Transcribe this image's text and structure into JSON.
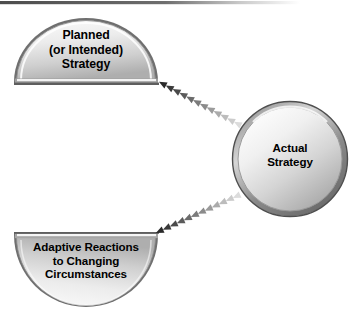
{
  "diagram": {
    "background_color": "#ffffff",
    "top_rule": {
      "name": "top-border-rule",
      "color": "#5a5a5a"
    },
    "nodes": [
      {
        "id": "planned-strategy",
        "shape": "dome-semicircle",
        "label": "Planned\n(or Intended)\nStrategy",
        "lines": [
          "Planned",
          "(or Intended)",
          "Strategy"
        ],
        "fill_light": "#f2f2f2",
        "fill_dark": "#b4b4b4",
        "border_color": "#6b6b6b"
      },
      {
        "id": "actual-strategy",
        "shape": "circle",
        "label": "Actual\nStrategy",
        "lines": [
          "Actual",
          "Strategy"
        ],
        "fill_light": "#f4f4f4",
        "fill_dark": "#b0b0b0",
        "border_color": "#707070"
      },
      {
        "id": "adaptive-reactions",
        "shape": "inverted-dome-semicircle",
        "label": "Adaptive Reactions\nto Changing\nCircumstances",
        "lines": [
          "Adaptive Reactions",
          "to Changing",
          "Circumstances"
        ],
        "fill_light": "#f2f2f2",
        "fill_dark": "#b4b4b4",
        "border_color": "#6b6b6b"
      }
    ],
    "connectors": [
      {
        "id": "planned-to-actual",
        "name": "dotted-arrow-planned-to-actual",
        "style": "chevron-dotted",
        "from": "planned-strategy",
        "to": "actual-strategy",
        "direction": "up-left",
        "color_near": "#2a2a2a",
        "color_far": "#dcdcdc",
        "marker_count": 12
      },
      {
        "id": "adaptive-to-actual",
        "name": "dotted-arrow-adaptive-to-actual",
        "style": "chevron-dotted",
        "from": "adaptive-reactions",
        "to": "actual-strategy",
        "direction": "down-left",
        "color_near": "#2a2a2a",
        "color_far": "#dcdcdc",
        "marker_count": 12
      }
    ]
  }
}
